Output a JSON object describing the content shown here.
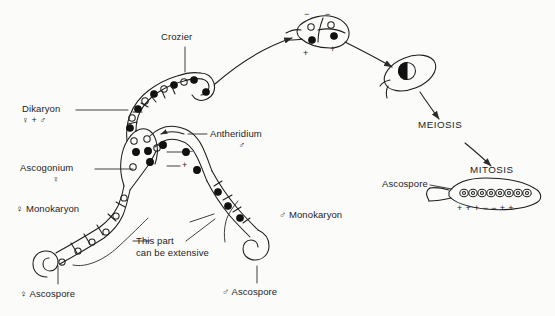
{
  "figure": {
    "type": "diagram",
    "background_color": "#fbfbf9",
    "ink_color": "#1d1d1d"
  },
  "labels": {
    "crozier": "Crozier",
    "dikaryon": "Dikaryon",
    "dikaryon_sub": "♀ + ♂",
    "antheridium": "Antheridium",
    "antheridium_sub": "♂",
    "ascogonium": "Ascogonium",
    "ascogonium_sub": "♀",
    "female_monokaryon": "♀ Monokaryon",
    "male_monokaryon": "♂ Monokaryon",
    "female_ascospore": "♀ Ascospore",
    "male_ascospore": "♂ Ascospore",
    "extensive_line1": "This part",
    "extensive_line2": "can be extensive",
    "meiosis": "MEIOSIS",
    "mitosis": "MITOSIS",
    "ascospore": "Ascospore"
  },
  "mating_type_signs": {
    "ascogonium_minus": "−",
    "ascogonium_plus": "+",
    "crozier_cell_minus_left": "−",
    "crozier_cell_minus_right": "−",
    "crozier_cell_plus_left": "+",
    "crozier_cell_plus_right": "+",
    "ascus_row": [
      "+",
      "+",
      "+",
      "−",
      "−",
      "+",
      "+"
    ]
  },
  "ascus": {
    "spore_count": 8,
    "spore_fill": "open",
    "description": "linear ascus containing eight ascospores"
  },
  "nuclei": {
    "filled_meaning": "female / minus nucleus",
    "open_meaning": "male / plus nucleus"
  },
  "icon_names": [
    "crozier-hook-icon",
    "ascogonium-icon",
    "antheridium-icon",
    "zygote-nucleus-icon",
    "ascus-icon",
    "arrow-icon",
    "leader-line-icon"
  ]
}
